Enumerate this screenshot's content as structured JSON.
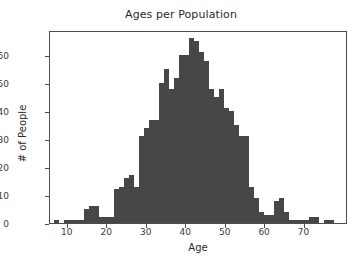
{
  "chart_data": {
    "type": "bar",
    "title": "Ages per Population",
    "xlabel": "Age",
    "ylabel": "# of People",
    "grid": false,
    "legend": null,
    "xlim": [
      5.5,
      81.0
    ],
    "ylim": [
      0,
      69
    ],
    "xticks": [
      10,
      20,
      30,
      40,
      50,
      60,
      70
    ],
    "yticks": [
      0,
      10,
      20,
      30,
      40,
      50,
      60
    ],
    "bin_width": 1.27,
    "bin_centers": [
      7.1,
      8.4,
      9.7,
      10.9,
      12.2,
      13.5,
      14.7,
      16.0,
      17.3,
      18.5,
      19.8,
      21.1,
      22.3,
      23.6,
      24.9,
      26.1,
      27.4,
      28.7,
      29.9,
      31.2,
      32.5,
      33.7,
      35.0,
      36.3,
      37.5,
      38.8,
      40.1,
      41.3,
      42.6,
      43.9,
      45.1,
      46.4,
      47.7,
      48.9,
      50.2,
      51.5,
      52.7,
      54.0,
      55.3,
      56.5,
      57.8,
      59.1,
      60.3,
      61.6,
      62.9,
      64.1,
      65.4,
      66.7,
      67.9,
      69.2,
      70.5,
      71.7,
      73.0,
      74.3,
      75.5,
      76.8
    ],
    "values": [
      1,
      0,
      1,
      1,
      1,
      1,
      5,
      6,
      6,
      2,
      2,
      2,
      12,
      13,
      16,
      17,
      13,
      31,
      34,
      37,
      37,
      50,
      55,
      48,
      52,
      60,
      60,
      66,
      65,
      61,
      58,
      48,
      45,
      48,
      41,
      40,
      35,
      31,
      31,
      13,
      9,
      4,
      3,
      3,
      8,
      9,
      4,
      1,
      1,
      1,
      1,
      2,
      2,
      0,
      1,
      1
    ],
    "bar_color": "#474747"
  },
  "axis": {
    "title": "Ages per Population",
    "xlabel": "Age",
    "ylabel": "# of People"
  }
}
